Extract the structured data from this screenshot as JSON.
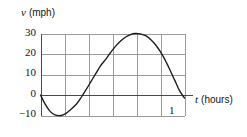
{
  "chart_data": {
    "type": "line",
    "title": "",
    "subtitle": "",
    "xlabel_var": "t",
    "xlabel_unit": "(hours)",
    "ylabel_var": "v",
    "ylabel_unit": "(mph)",
    "xlim": [
      0,
      1.2
    ],
    "ylim": [
      -10,
      30
    ],
    "grid": true,
    "legend": "none",
    "xticks": [
      1
    ],
    "xticklabels": [
      "1"
    ],
    "yticks": [
      -10,
      0,
      10,
      20,
      30
    ],
    "yticklabels": [
      "−10",
      "0",
      "10",
      "20",
      "30"
    ],
    "x_gridlines": [
      0,
      0.2,
      0.4,
      0.6,
      0.8,
      1.0,
      1.2
    ],
    "y_gridlines": [
      -10,
      0,
      10,
      20,
      30
    ],
    "series": [
      {
        "name": "velocity",
        "color": "#1a1a1a",
        "x": [
          0.0,
          0.04,
          0.08,
          0.12,
          0.17,
          0.21,
          0.25,
          0.3,
          0.34,
          0.38,
          0.42,
          0.46,
          0.5,
          0.55,
          0.59,
          0.63,
          0.67,
          0.71,
          0.75,
          0.79,
          0.83,
          0.88,
          0.92,
          0.96,
          1.0,
          1.04,
          1.08,
          1.12,
          1.16,
          1.2
        ],
        "y": [
          0.0,
          -4.6,
          -8.0,
          -9.7,
          -10.0,
          -9.1,
          -7.2,
          -4.4,
          -1.1,
          2.6,
          6.5,
          10.4,
          14.2,
          17.9,
          21.2,
          24.1,
          26.5,
          28.3,
          29.5,
          30.0,
          29.8,
          28.8,
          27.0,
          24.4,
          21.0,
          16.9,
          12.1,
          7.0,
          2.0,
          -1.5
        ]
      }
    ],
    "annotations": {
      "minimum": {
        "t": 0.17,
        "v": -10
      },
      "zero_crossing": {
        "t": 0.36,
        "v": 0
      },
      "maximum": {
        "t": 0.79,
        "v": 30
      }
    },
    "colors": {
      "curve": "#1a1a1a",
      "axis": "#4a4a4a",
      "grid": "#9a9a9a",
      "background": "#ffffff",
      "text": "#141414"
    }
  },
  "figure": {
    "ylabel": {
      "var": "v",
      "unit": "(mph)"
    },
    "xlabel": {
      "var": "t",
      "unit": "(hours)"
    },
    "yticks": {
      "t30": "30",
      "t20": "20",
      "t10": "10",
      "t0": "0",
      "tm10": "−10"
    },
    "xticks": {
      "t1": "1"
    }
  }
}
